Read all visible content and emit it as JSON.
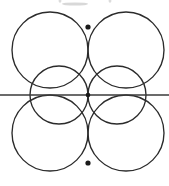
{
  "figure": {
    "background_color": "#ffffff",
    "stroke_color": "#2b2b2b",
    "axis_color": "#3a3a3a",
    "dot_color": "#1a1a1a",
    "canvas": {
      "width": 169,
      "height": 186
    }
  },
  "chart_data": {
    "type": "diagram",
    "xlabel": "",
    "ylabel": "",
    "circles": [
      {
        "name": "top-left-circle",
        "cx": 50,
        "cy": 50,
        "r": 38
      },
      {
        "name": "top-right-circle",
        "cx": 126,
        "cy": 50,
        "r": 38
      },
      {
        "name": "bottom-left-circle",
        "cx": 50,
        "cy": 133,
        "r": 38
      },
      {
        "name": "bottom-right-circle",
        "cx": 126,
        "cy": 133,
        "r": 38
      },
      {
        "name": "left-medium-circle",
        "cx": 59,
        "cy": 95,
        "r": 29
      },
      {
        "name": "right-medium-circle",
        "cx": 117,
        "cy": 95,
        "r": 29
      }
    ],
    "lines": [
      {
        "name": "horizontal-axis",
        "x1": 0,
        "y1": 95,
        "x2": 169,
        "y2": 95
      }
    ],
    "marked_points": [
      {
        "name": "top-vertex",
        "x": 88,
        "y": 27,
        "r": 2.6
      },
      {
        "name": "center-vertex",
        "x": 88,
        "y": 95,
        "r": 2.3
      },
      {
        "name": "bottom-vertex",
        "x": 88,
        "y": 163,
        "r": 2.6
      }
    ],
    "crossings": [
      {
        "name": "left-axis-crossing",
        "x": 30,
        "y": 95
      },
      {
        "name": "right-axis-crossing",
        "x": 147,
        "y": 95
      }
    ],
    "artifacts": [
      {
        "name": "top-smudge",
        "cx": 75,
        "cy": 4,
        "rx": 13,
        "ry": 1.6
      },
      {
        "name": "top-left-speck",
        "cx": 60,
        "cy": 1,
        "rx": 1.4,
        "ry": 1.8
      },
      {
        "name": "top-right-speck",
        "cx": 110,
        "cy": 1,
        "rx": 1.4,
        "ry": 1.8
      }
    ],
    "grid": false,
    "legend": false
  }
}
